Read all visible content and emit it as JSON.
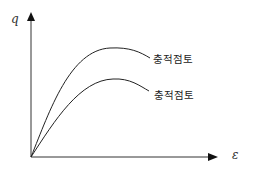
{
  "diagram": {
    "type": "stress-strain curves",
    "y_axis_label": "q",
    "x_axis_label": "ε",
    "curves": [
      {
        "label": "충적점토",
        "position": "upper"
      },
      {
        "label": "충적점토",
        "position": "lower"
      }
    ]
  }
}
